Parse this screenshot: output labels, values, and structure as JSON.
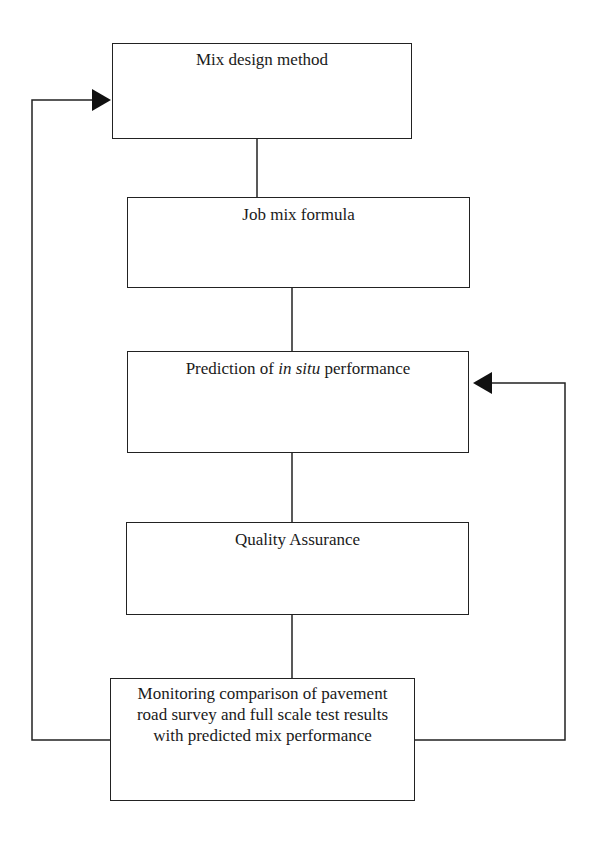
{
  "diagram": {
    "type": "flowchart",
    "nodes": [
      {
        "id": "n1",
        "label": "Mix design method"
      },
      {
        "id": "n2",
        "label": "Job mix formula"
      },
      {
        "id": "n3",
        "label_pre": "Prediction of ",
        "label_italic": "in situ",
        "label_post": " performance"
      },
      {
        "id": "n4",
        "label": "Quality Assurance"
      },
      {
        "id": "n5",
        "lines": [
          "Monitoring comparison of pavement",
          "road survey and full scale test results",
          "with predicted mix performance"
        ]
      }
    ],
    "edges": [
      {
        "from": "n1",
        "to": "n2",
        "style": "line"
      },
      {
        "from": "n2",
        "to": "n3",
        "style": "line"
      },
      {
        "from": "n3",
        "to": "n4",
        "style": "line"
      },
      {
        "from": "n4",
        "to": "n5",
        "style": "line"
      },
      {
        "from": "n5",
        "to": "n1",
        "style": "arrow",
        "route": "left-loop"
      },
      {
        "from": "n5",
        "to": "n3",
        "style": "arrow",
        "route": "right-loop"
      }
    ],
    "colors": {
      "stroke": "#222222",
      "background": "#ffffff"
    }
  }
}
